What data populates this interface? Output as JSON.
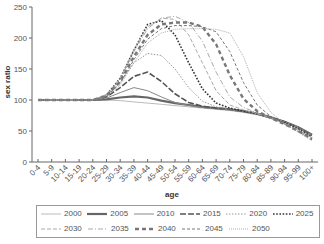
{
  "chart_data": {
    "type": "line",
    "title": "",
    "xlabel": "age",
    "ylabel": "sex ratio",
    "ylim": [
      0,
      250
    ],
    "yticks": [
      0,
      50,
      100,
      150,
      200,
      250
    ],
    "grid": false,
    "legend_position": "bottom",
    "categories": [
      "0-4",
      "5-9",
      "10-14",
      "15-19",
      "20-24",
      "25-29",
      "30-34",
      "35-39",
      "40-44",
      "45-49",
      "50-54",
      "55-59",
      "60-64",
      "65-69",
      "70-74",
      "75-79",
      "80-84",
      "85-89",
      "90-94",
      "95-99",
      "100+"
    ],
    "series": [
      {
        "name": "2000",
        "style": "thin-solid-light",
        "values": [
          100,
          100,
          100,
          100,
          100,
          100,
          99,
          97,
          95,
          93,
          91,
          89,
          87,
          85,
          83,
          80,
          76,
          71,
          64,
          55,
          42
        ]
      },
      {
        "name": "2005",
        "style": "thick-solid",
        "values": [
          100,
          100,
          100,
          100,
          100,
          101,
          104,
          106,
          104,
          99,
          95,
          92,
          89,
          87,
          85,
          82,
          78,
          72,
          65,
          56,
          44
        ]
      },
      {
        "name": "2010",
        "style": "solid",
        "values": [
          100,
          100,
          100,
          100,
          100,
          103,
          112,
          120,
          115,
          105,
          96,
          91,
          88,
          86,
          84,
          81,
          77,
          72,
          65,
          56,
          44
        ]
      },
      {
        "name": "2015",
        "style": "dash-solid-dark",
        "values": [
          100,
          100,
          100,
          100,
          100,
          105,
          120,
          138,
          145,
          130,
          110,
          96,
          90,
          87,
          85,
          82,
          78,
          72,
          65,
          55,
          43
        ]
      },
      {
        "name": "2020",
        "style": "dotted",
        "values": [
          100,
          100,
          100,
          100,
          100,
          107,
          128,
          160,
          175,
          172,
          150,
          120,
          98,
          89,
          85,
          82,
          78,
          72,
          65,
          55,
          42
        ]
      },
      {
        "name": "2025",
        "style": "bold-dotted",
        "values": [
          100,
          100,
          100,
          100,
          100,
          108,
          135,
          180,
          222,
          228,
          205,
          160,
          118,
          95,
          87,
          82,
          78,
          71,
          63,
          53,
          40
        ]
      },
      {
        "name": "2030",
        "style": "dashed-light",
        "values": [
          100,
          100,
          100,
          100,
          100,
          108,
          135,
          182,
          218,
          232,
          230,
          205,
          160,
          115,
          92,
          84,
          78,
          71,
          62,
          52,
          39
        ]
      },
      {
        "name": "2035",
        "style": "dash-dot-light",
        "values": [
          100,
          100,
          100,
          100,
          100,
          108,
          133,
          178,
          215,
          232,
          235,
          225,
          195,
          145,
          105,
          88,
          79,
          71,
          62,
          51,
          38
        ]
      },
      {
        "name": "2040",
        "style": "thick-dashed",
        "values": [
          100,
          100,
          100,
          100,
          100,
          107,
          130,
          170,
          205,
          222,
          225,
          225,
          218,
          190,
          140,
          102,
          82,
          71,
          61,
          50,
          37
        ]
      },
      {
        "name": "2045",
        "style": "dashed",
        "values": [
          100,
          100,
          100,
          100,
          100,
          106,
          127,
          165,
          198,
          215,
          220,
          220,
          218,
          210,
          178,
          128,
          92,
          73,
          61,
          49,
          36
        ]
      },
      {
        "name": "2050",
        "style": "fine-dotted",
        "values": [
          100,
          100,
          100,
          100,
          100,
          105,
          124,
          160,
          192,
          208,
          214,
          215,
          215,
          214,
          208,
          170,
          112,
          80,
          62,
          48,
          34
        ]
      }
    ]
  },
  "legend": {
    "rows": [
      [
        "2000",
        "2005",
        "2010",
        "2015",
        "2020",
        "2025"
      ],
      [
        "2030",
        "2035",
        "2040",
        "2045",
        "2050"
      ]
    ]
  }
}
